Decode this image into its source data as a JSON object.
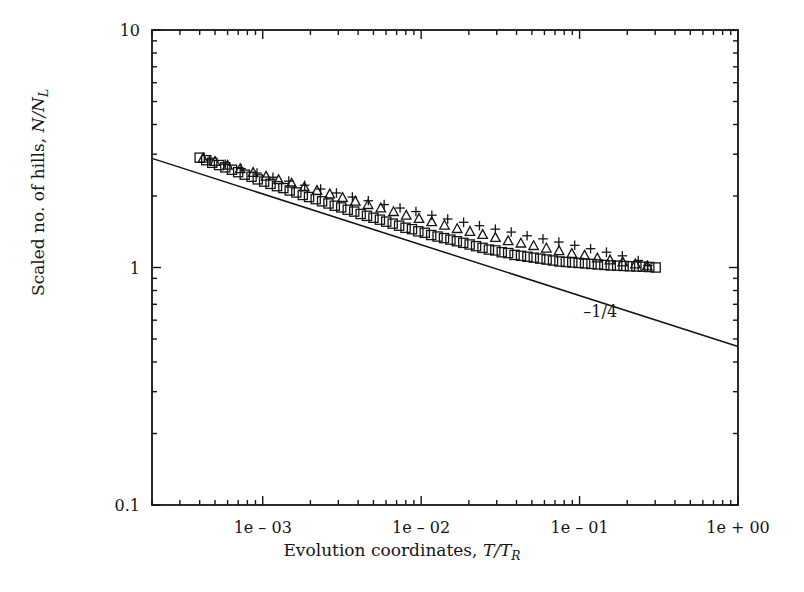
{
  "figure": {
    "background": "#ffffff",
    "ink": "#141414"
  },
  "axes": {
    "x_label_prefix": "Evolution coordinates, ",
    "x_label_math_num": "T",
    "x_label_math_den": "T",
    "x_label_math_sub": "R",
    "y_label_prefix": "Scaled no. of hills, ",
    "y_label_math_num": "N",
    "y_label_math_den": "N",
    "y_label_math_sub": "L",
    "x_ticks": [
      "1e – 03",
      "1e – 02",
      "1e – 01",
      "1e + 00"
    ],
    "y_ticks": [
      "10",
      "1",
      "0.1"
    ]
  },
  "annotations": {
    "slope_label": "–1/4"
  },
  "chart_data": {
    "type": "scatter",
    "title": "",
    "xlabel": "Evolution coordinates, T/T_R",
    "ylabel": "Scaled no. of hills, N/N_L",
    "xscale": "log",
    "yscale": "log",
    "xlim": [
      0.0002,
      1.0
    ],
    "ylim": [
      0.1,
      10
    ],
    "grid": false,
    "legend": "none",
    "xtick_values": [
      0.001,
      0.01,
      0.1,
      1.0
    ],
    "xtick_labels": [
      "1e – 03",
      "1e – 02",
      "1e – 01",
      "1e + 00"
    ],
    "ytick_values": [
      10,
      1,
      0.1
    ],
    "ytick_labels": [
      "10",
      "1",
      "0.1"
    ],
    "reference_line": {
      "label": "–1/4",
      "slope": -0.25,
      "x": [
        0.0002,
        1.0
      ],
      "y": [
        2.88,
        0.465
      ],
      "label_x": 0.135,
      "label_y": 0.62
    },
    "series": [
      {
        "name": "squares",
        "marker": "square",
        "x": [
          0.0004,
          0.00044,
          0.00048,
          0.00053,
          0.00058,
          0.00064,
          0.0007,
          0.00077,
          0.00085,
          0.00093,
          0.00102,
          0.00112,
          0.00123,
          0.00135,
          0.00148,
          0.00163,
          0.00179,
          0.00196,
          0.00216,
          0.00237,
          0.0026,
          0.00285,
          0.00313,
          0.00344,
          0.00378,
          0.00415,
          0.00455,
          0.005,
          0.00549,
          0.00602,
          0.00661,
          0.00726,
          0.00797,
          0.00875,
          0.0096,
          0.01054,
          0.01157,
          0.0127,
          0.01394,
          0.0153,
          0.0168,
          0.01844,
          0.02024,
          0.02222,
          0.02439,
          0.02677,
          0.02939,
          0.03226,
          0.03541,
          0.03887,
          0.04267,
          0.04683,
          0.05141,
          0.05643,
          0.06194,
          0.06799,
          0.07463,
          0.08192,
          0.08992,
          0.09871,
          0.10835,
          0.11894,
          0.13056,
          0.14332,
          0.15732,
          0.17269,
          0.18957,
          0.20809,
          0.22842,
          0.25074,
          0.27524,
          0.30213
        ],
        "y": [
          2.9,
          2.83,
          2.76,
          2.7,
          2.64,
          2.58,
          2.52,
          2.46,
          2.41,
          2.35,
          2.3,
          2.25,
          2.2,
          2.16,
          2.11,
          2.07,
          2.02,
          1.98,
          1.94,
          1.9,
          1.86,
          1.82,
          1.79,
          1.75,
          1.72,
          1.68,
          1.65,
          1.62,
          1.59,
          1.56,
          1.53,
          1.5,
          1.47,
          1.45,
          1.42,
          1.4,
          1.37,
          1.35,
          1.33,
          1.31,
          1.29,
          1.27,
          1.25,
          1.23,
          1.21,
          1.19,
          1.18,
          1.16,
          1.15,
          1.13,
          1.12,
          1.11,
          1.1,
          1.09,
          1.08,
          1.07,
          1.06,
          1.055,
          1.05,
          1.045,
          1.04,
          1.035,
          1.03,
          1.025,
          1.02,
          1.018,
          1.015,
          1.012,
          1.01,
          1.008,
          1.005,
          1.0
        ]
      },
      {
        "name": "triangles",
        "marker": "triangle",
        "x": [
          0.00042,
          0.0005,
          0.0006,
          0.00072,
          0.00087,
          0.00105,
          0.00126,
          0.00152,
          0.00183,
          0.0022,
          0.00265,
          0.00319,
          0.00384,
          0.00462,
          0.00556,
          0.00669,
          0.00805,
          0.00969,
          0.01166,
          0.01403,
          0.01688,
          0.02032,
          0.02445,
          0.02942,
          0.03541,
          0.04261,
          0.05128,
          0.0617,
          0.07425,
          0.08934,
          0.10751,
          0.12937,
          0.15567,
          0.18733,
          0.22543,
          0.2677
        ],
        "y": [
          2.87,
          2.78,
          2.68,
          2.59,
          2.5,
          2.41,
          2.33,
          2.25,
          2.17,
          2.1,
          2.03,
          1.96,
          1.89,
          1.83,
          1.77,
          1.71,
          1.65,
          1.6,
          1.55,
          1.5,
          1.45,
          1.41,
          1.37,
          1.33,
          1.29,
          1.26,
          1.23,
          1.2,
          1.17,
          1.14,
          1.12,
          1.09,
          1.07,
          1.05,
          1.03,
          1.01
        ]
      },
      {
        "name": "plus",
        "marker": "plus",
        "x": [
          0.00046,
          0.00058,
          0.00073,
          0.00092,
          0.00116,
          0.00146,
          0.00184,
          0.00232,
          0.00292,
          0.00368,
          0.00464,
          0.00584,
          0.00736,
          0.00927,
          0.01168,
          0.01471,
          0.01853,
          0.02334,
          0.0294,
          0.03703,
          0.04664,
          0.05874,
          0.07398,
          0.09319,
          0.11737,
          0.14783,
          0.18618,
          0.2345,
          0.27
        ],
        "y": [
          2.84,
          2.72,
          2.61,
          2.5,
          2.4,
          2.31,
          2.22,
          2.14,
          2.06,
          1.98,
          1.91,
          1.84,
          1.78,
          1.72,
          1.66,
          1.6,
          1.55,
          1.5,
          1.45,
          1.41,
          1.36,
          1.32,
          1.28,
          1.24,
          1.2,
          1.16,
          1.12,
          1.07,
          1.02
        ]
      }
    ]
  }
}
